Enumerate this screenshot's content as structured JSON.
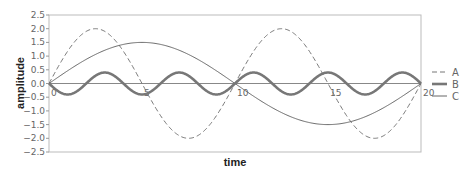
{
  "chart_data": {
    "type": "line",
    "title": "",
    "xlabel": "time",
    "ylabel": "amplitude",
    "xlim": [
      0,
      20
    ],
    "ylim": [
      -2.5,
      2.5
    ],
    "x_ticks": [
      "0",
      "5",
      "10",
      "15",
      "20"
    ],
    "y_ticks": [
      "2.5",
      "2.0",
      "1.5",
      "1.0",
      "0.5",
      "0.0",
      "−0.5",
      "−1.0",
      "−1.5",
      "−2.0",
      "−2.5"
    ],
    "grid": false,
    "legend_position": "right",
    "series": [
      {
        "name": "A",
        "style": "dashed",
        "formula": "2*sin(2*pi*t/10)",
        "amplitude": 2.0,
        "period": 10,
        "x": [
          0,
          2.5,
          5,
          7.5,
          10,
          12.5,
          15,
          17.5,
          20
        ],
        "values": [
          0,
          2.0,
          0,
          -2.0,
          0,
          2.0,
          0,
          -2.0,
          0
        ]
      },
      {
        "name": "B",
        "style": "thick",
        "formula": "-0.4*sin(2*pi*t/4)",
        "amplitude": 0.4,
        "period": 4,
        "x": [
          0,
          1,
          2,
          3,
          4,
          5,
          6,
          7,
          8,
          9,
          10,
          11,
          12,
          13,
          14,
          15,
          16,
          17,
          18,
          19,
          20
        ],
        "values": [
          0,
          -0.4,
          0,
          0.4,
          0,
          -0.4,
          0,
          0.4,
          0,
          -0.4,
          0,
          0.4,
          0,
          -0.4,
          0,
          0.4,
          0,
          -0.4,
          0,
          0.4,
          0
        ]
      },
      {
        "name": "C",
        "style": "thin",
        "formula": "1.5*sin(2*pi*t/20)",
        "amplitude": 1.5,
        "period": 20,
        "x": [
          0,
          5,
          10,
          15,
          20
        ],
        "values": [
          0,
          1.5,
          0,
          -1.5,
          0
        ]
      }
    ]
  },
  "legend": {
    "a": "A",
    "b": "B",
    "c": "C"
  },
  "axes": {
    "x_label": "time",
    "y_label": "amplitude"
  }
}
